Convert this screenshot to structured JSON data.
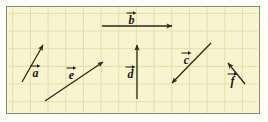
{
  "figure": {
    "background_color": "#f7f4cf",
    "grid_color": "#e3dfa8",
    "border_color": "#8a8a78",
    "vector_color": "#2b2a14",
    "outer_background": "#fdfdf8",
    "grid": {
      "cell_width": 18,
      "cell_height": 18,
      "columns": 14,
      "rows": 6
    }
  },
  "chart_data": {
    "type": "scatter",
    "xlabel": "",
    "ylabel": "",
    "xlim": [
      0,
      254
    ],
    "ylim": [
      0,
      108
    ],
    "grid": true,
    "legend": "none",
    "annotations": [
      "a",
      "b",
      "c",
      "d",
      "e",
      "f"
    ],
    "series": [
      {
        "name": "a",
        "tail": [
          22,
          82
        ],
        "head": [
          43,
          45
        ],
        "dx": 21,
        "dy": 37,
        "direction": "up-right"
      },
      {
        "name": "b",
        "tail": [
          102,
          26
        ],
        "head": [
          172,
          26
        ],
        "dx": 70,
        "dy": 0,
        "direction": "right"
      },
      {
        "name": "c",
        "tail": [
          211,
          43
        ],
        "head": [
          172,
          83
        ],
        "dx": -39,
        "dy": -40,
        "direction": "down-left"
      },
      {
        "name": "d",
        "tail": [
          137,
          99
        ],
        "head": [
          137,
          45
        ],
        "dx": 0,
        "dy": 54,
        "direction": "up"
      },
      {
        "name": "e",
        "tail": [
          45,
          101
        ],
        "head": [
          103,
          62
        ],
        "dx": 58,
        "dy": 39,
        "direction": "up-right"
      },
      {
        "name": "f",
        "tail": [
          245,
          84
        ],
        "head": [
          228,
          63
        ],
        "dx": -17,
        "dy": 21,
        "direction": "up-left"
      }
    ]
  },
  "labels": [
    {
      "id": "a",
      "text": "a",
      "x": 30,
      "y": 64
    },
    {
      "id": "b",
      "text": "b",
      "x": 126,
      "y": 11
    },
    {
      "id": "c",
      "text": "c",
      "x": 181,
      "y": 51
    },
    {
      "id": "d",
      "text": "d",
      "x": 125,
      "y": 65
    },
    {
      "id": "e",
      "text": "e",
      "x": 66,
      "y": 66
    },
    {
      "id": "f",
      "text": "f",
      "x": 227,
      "y": 72
    }
  ]
}
